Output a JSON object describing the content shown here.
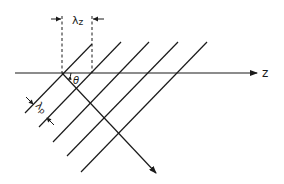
{
  "diagram": {
    "axis_label": "z",
    "angle_label": "θ",
    "wavelength_z_label": "λz",
    "wavelength_z_main": "λ",
    "wavelength_z_sub": "z",
    "wavelength_p_main": "λ",
    "wavelength_p_sub": "p",
    "colors": {
      "line": "#1a1a1a",
      "background": "#ffffff"
    },
    "wavefront_count": 5
  }
}
